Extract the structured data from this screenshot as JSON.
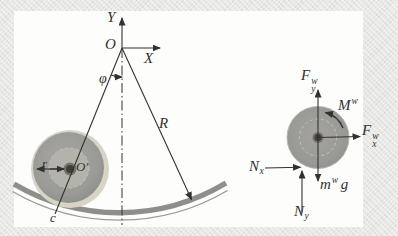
{
  "labels": {
    "y_axis": "Y",
    "origin": "O",
    "x_axis": "X",
    "angle": "φ",
    "track_radius": "R",
    "wheel_radius": "r",
    "wheel_center": "O′",
    "contact": "c"
  },
  "fbd_labels": {
    "force_y": {
      "base": "F",
      "sup": "w",
      "sub": "y"
    },
    "moment": {
      "base": "M",
      "sup": "w"
    },
    "force_x": {
      "base": "F",
      "sup": "w",
      "sub": "x"
    },
    "normal_x": {
      "base": "N",
      "sub": "x"
    },
    "weight": {
      "base": "m",
      "sup": "w",
      "tail": "g"
    },
    "normal_y": {
      "base": "N",
      "sub": "y"
    }
  },
  "colors": {
    "page_bg": "#e8e8e6",
    "panel_bg": "#fdfdfc",
    "ink": "#32322f",
    "wheel_rim": "#d7d3c5",
    "wheel_disc": "#9a9a97",
    "wheel_inner": "#b3b2ab",
    "hub_dark": "#403f3b",
    "hub_ring": "#74736e",
    "track": "#8e8e8b"
  }
}
